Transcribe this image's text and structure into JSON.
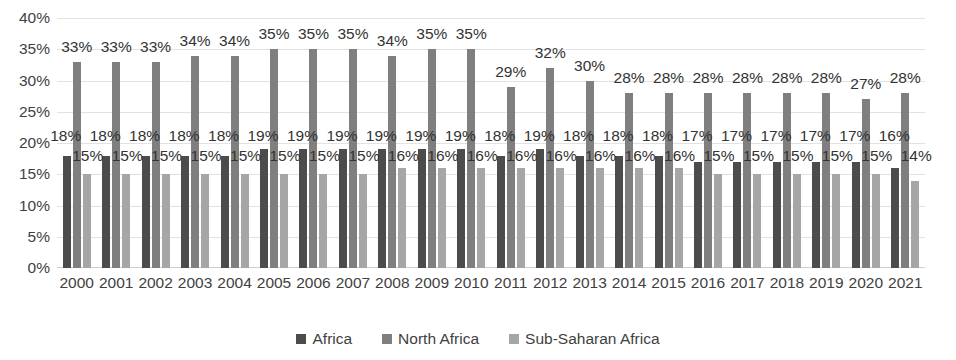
{
  "chart_data": {
    "type": "bar",
    "title": "",
    "subtitle": "",
    "xlabel": "",
    "ylabel": "",
    "ylim": [
      0,
      40
    ],
    "y_tick_labels": [
      "0%",
      "5%",
      "10%",
      "15%",
      "20%",
      "25%",
      "30%",
      "35%",
      "40%"
    ],
    "y_tick_values": [
      0,
      5,
      10,
      15,
      20,
      25,
      30,
      35,
      40
    ],
    "grid": true,
    "legend_position": "bottom-center",
    "value_suffix": "%",
    "categories": [
      "2000",
      "2001",
      "2002",
      "2003",
      "2004",
      "2005",
      "2006",
      "2007",
      "2008",
      "2009",
      "2010",
      "2011",
      "2012",
      "2013",
      "2014",
      "2015",
      "2016",
      "2017",
      "2018",
      "2019",
      "2020",
      "2021"
    ],
    "series": [
      {
        "name": "Africa",
        "color": "#4c4c4c",
        "values": [
          18,
          18,
          18,
          18,
          18,
          19,
          19,
          19,
          19,
          19,
          19,
          18,
          19,
          18,
          18,
          18,
          17,
          17,
          17,
          17,
          17,
          16
        ],
        "labels": [
          "18%",
          "18%",
          "18%",
          "18%",
          "18%",
          "19%",
          "19%",
          "19%",
          "19%",
          "19%",
          "19%",
          "18%",
          "19%",
          "18%",
          "18%",
          "18%",
          "17%",
          "17%",
          "17%",
          "17%",
          "17%",
          "16%"
        ]
      },
      {
        "name": "North Africa",
        "color": "#7f7f7f",
        "values": [
          33,
          33,
          33,
          34,
          34,
          35,
          35,
          35,
          34,
          35,
          35,
          29,
          32,
          30,
          28,
          28,
          28,
          28,
          28,
          28,
          27,
          28
        ],
        "labels": [
          "33%",
          "33%",
          "33%",
          "34%",
          "34%",
          "35%",
          "35%",
          "35%",
          "34%",
          "35%",
          "35%",
          "29%",
          "32%",
          "30%",
          "28%",
          "28%",
          "28%",
          "28%",
          "28%",
          "28%",
          "27%",
          "28%"
        ]
      },
      {
        "name": "Sub-Saharan Africa",
        "color": "#a6a6a6",
        "values": [
          15,
          15,
          15,
          15,
          15,
          15,
          15,
          15,
          16,
          16,
          16,
          16,
          16,
          16,
          16,
          16,
          15,
          15,
          15,
          15,
          15,
          14
        ],
        "labels": [
          "15%",
          "15%",
          "15%",
          "15%",
          "15%",
          "15%",
          "15%",
          "15%",
          "16%",
          "16%",
          "16%",
          "16%",
          "16%",
          "16%",
          "16%",
          "16%",
          "15%",
          "15%",
          "15%",
          "15%",
          "15%",
          "14%"
        ]
      }
    ]
  },
  "legend": {
    "items": [
      {
        "label": "Africa",
        "color": "#4c4c4c"
      },
      {
        "label": "North Africa",
        "color": "#7f7f7f"
      },
      {
        "label": "Sub-Saharan Africa",
        "color": "#a6a6a6"
      }
    ]
  }
}
